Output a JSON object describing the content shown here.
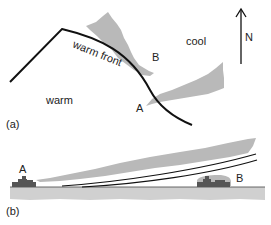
{
  "panel_a": {
    "label": "(a)",
    "front_label": "warm front",
    "warm_label": "warm",
    "cool_label": "cool",
    "point_a": "A",
    "point_b": "B",
    "north_label": "N"
  },
  "panel_b": {
    "label": "(b)",
    "point_a": "A",
    "point_b": "B"
  },
  "colors": {
    "cloud": "#b9b9b9",
    "ground": "#d0d0d0",
    "building": "#555555",
    "line": "#111111",
    "text": "#222222"
  }
}
